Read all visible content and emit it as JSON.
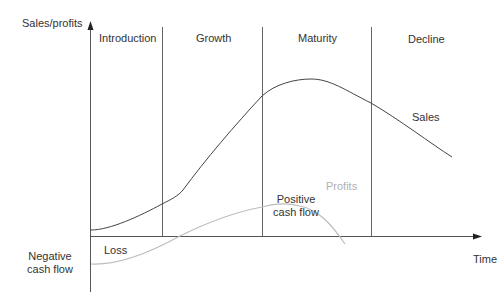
{
  "diagram": {
    "y_axis_label": "Sales/profits",
    "x_axis_label": "Time",
    "stages": [
      {
        "label": "Introduction"
      },
      {
        "label": "Growth"
      },
      {
        "label": "Maturity"
      },
      {
        "label": "Decline"
      }
    ],
    "curves": [
      {
        "name": "Sales",
        "color": "#444444"
      },
      {
        "name": "Profits",
        "color": "#bdbdbd"
      }
    ],
    "annotations": {
      "loss": "Loss",
      "negative_cash_flow_line1": "Negative",
      "negative_cash_flow_line2": "cash flow",
      "positive_cash_flow_line1": "Positive",
      "positive_cash_flow_line2": "cash flow"
    }
  }
}
